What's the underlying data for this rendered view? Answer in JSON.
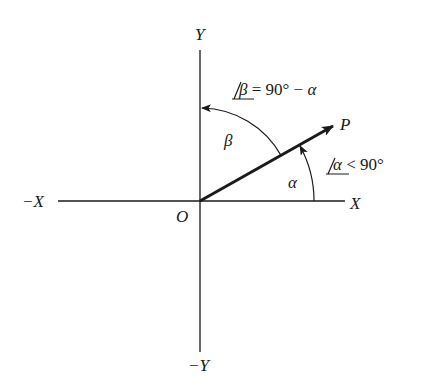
{
  "diagram": {
    "type": "vector-angle-diagram",
    "axes": {
      "pos_x": "X",
      "neg_x": "−X",
      "pos_y": "Y",
      "neg_y": "−Y",
      "origin": "O"
    },
    "vector": {
      "label": "P"
    },
    "angles": {
      "alpha": {
        "symbol": "α",
        "relation_angle": "α",
        "relation_rest": " < 90°"
      },
      "beta": {
        "symbol": "β",
        "relation_angle": "β",
        "relation_rest": " = 90° − ",
        "relation_tail": "α"
      }
    },
    "colors": {
      "stroke": "#1a1a1a",
      "background": "#ffffff"
    }
  }
}
